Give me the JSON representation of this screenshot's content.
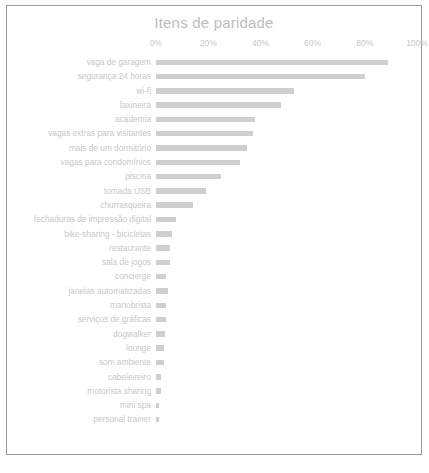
{
  "card": {
    "title": "Itens de paridade",
    "border_color": "#9a9a9a",
    "background": "#ffffff"
  },
  "footnote": "",
  "chart_data": {
    "type": "bar",
    "orientation": "horizontal",
    "title": "Itens de paridade",
    "xlabel": "",
    "ylabel": "",
    "xlim": [
      0,
      100
    ],
    "xticks": [
      "0%",
      "20%",
      "40%",
      "60%",
      "80%",
      "100%"
    ],
    "xtick_values": [
      0,
      20,
      40,
      60,
      80,
      100
    ],
    "grid": false,
    "legend": "none",
    "bar_color": "#cfcfcf",
    "label_color": "#c8c8c8",
    "categories": [
      "vaga de garagem",
      "segurança 24 horas",
      "wi-fi",
      "faxineira",
      "academia",
      "vagas extras para visitantes",
      "mais de um dormitório",
      "vagas para condomínios",
      "piscina",
      "tomada USB",
      "churrasqueira",
      "fechaduras de impressão digital",
      "bike-sharing - bicicletas",
      "restaurante",
      "sala de jogos",
      "concierge",
      "janelas automatizadas",
      "manobrista",
      "serviços de gráficas",
      "dogwalker",
      "lounge",
      "som ambiente",
      "cabeleireiro",
      "motorista sharing",
      "mini spa",
      "personal trainer"
    ],
    "values": [
      89,
      80,
      53,
      48,
      38,
      37,
      35,
      32,
      25,
      19,
      14,
      7.5,
      6,
      5.5,
      5.5,
      4,
      4.5,
      4,
      4,
      3.5,
      3,
      3,
      2,
      2,
      1.2,
      1
    ]
  }
}
